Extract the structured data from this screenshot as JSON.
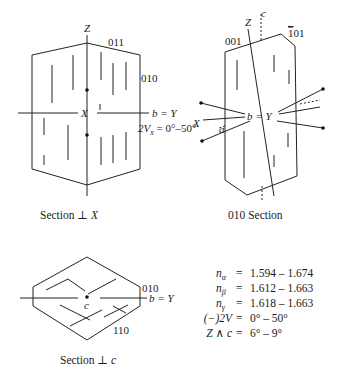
{
  "section_x": {
    "caption": "Section ⊥ ",
    "caption_axis": "X",
    "labels": {
      "z_axis": "Z",
      "face_011": "011",
      "face_010": "010",
      "x_axis": "X",
      "b_axis": "b = Y",
      "twoV_prefix": "2V",
      "twoV_sub": "x",
      "twoV_value": " = 0°–50°"
    }
  },
  "section_010": {
    "caption": "010 Section",
    "labels": {
      "z_axis": "Z",
      "c_axis": "c",
      "face_001": "001",
      "face_101": "̄101",
      "face_101_bar": "1",
      "face_101_rest": "01",
      "b_axis": "b = Y",
      "x_axis": "X",
      "a_axis": "a"
    }
  },
  "section_c": {
    "caption": "Section ⊥ ",
    "caption_axis": "c",
    "labels": {
      "face_010": "010",
      "face_110": "110",
      "b_axis": "b = Y",
      "c_axis": "c"
    }
  },
  "properties": [
    {
      "name": "n",
      "sub": "α",
      "value": "1.594 – 1.674"
    },
    {
      "name": "n",
      "sub": "β",
      "value": "1.612 – 1.663"
    },
    {
      "name": "n",
      "sub": "γ",
      "value": "1.618 – 1.663"
    },
    {
      "name": "(−)2V",
      "sub": "",
      "value": "0° – 50°"
    },
    {
      "name": "Z ∧ c",
      "sub": "",
      "value": "6° – 9°"
    }
  ],
  "equals": "="
}
